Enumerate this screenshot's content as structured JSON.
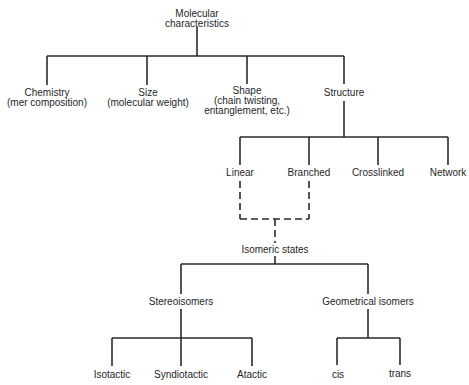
{
  "diagram": {
    "type": "tree",
    "root": {
      "label_lines": [
        "Molecular",
        "characteristics"
      ]
    },
    "level1": [
      {
        "label_lines": [
          "Chemistry",
          "(mer composition)"
        ]
      },
      {
        "label_lines": [
          "Size",
          "(molecular weight)"
        ]
      },
      {
        "label_lines": [
          "Shape",
          "(chain twisting,",
          "entanglement, etc.)"
        ]
      },
      {
        "label_lines": [
          "Structure"
        ]
      }
    ],
    "structure_children": [
      {
        "label": "Linear"
      },
      {
        "label": "Branched"
      },
      {
        "label": "Crosslinked"
      },
      {
        "label": "Network"
      }
    ],
    "isomeric": {
      "label": "Isomeric states",
      "connection_style": "dashed from Linear and Branched"
    },
    "isomer_types": [
      {
        "label": "Stereoisomers"
      },
      {
        "label": "Geometrical isomers"
      }
    ],
    "stereo_children": [
      {
        "label": "Isotactic"
      },
      {
        "label": "Syndiotactic"
      },
      {
        "label": "Atactic"
      }
    ],
    "geometric_children": [
      {
        "label": "cis"
      },
      {
        "label": "trans"
      }
    ],
    "line_color": "#2a2a2a"
  }
}
